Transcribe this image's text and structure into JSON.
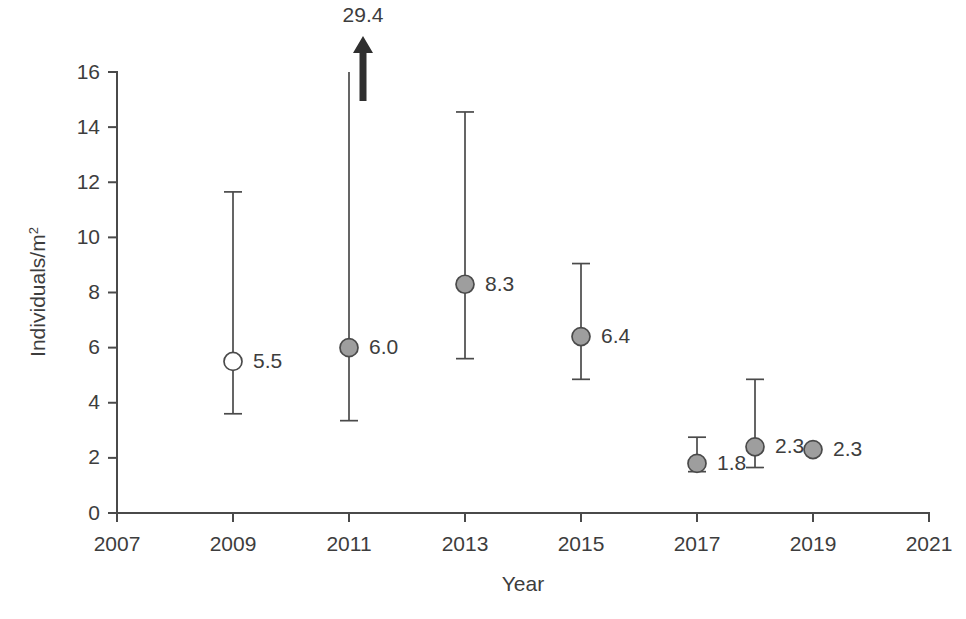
{
  "chart_data": {
    "type": "scatter",
    "title": "",
    "xlabel": "Year",
    "ylabel": "Individuals/m2",
    "ylabel_base": "Individuals/m",
    "ylabel_superscript": "2",
    "xlim": [
      2007,
      2021
    ],
    "ylim": [
      0,
      16
    ],
    "xticks": [
      "2007",
      "2009",
      "2011",
      "2013",
      "2015",
      "2017",
      "2019",
      "2021"
    ],
    "xtick_values": [
      2007,
      2009,
      2011,
      2013,
      2015,
      2017,
      2019,
      2021
    ],
    "yticks": [
      "0",
      "2",
      "4",
      "6",
      "8",
      "10",
      "12",
      "14",
      "16"
    ],
    "ytick_values": [
      0,
      2,
      4,
      6,
      8,
      10,
      12,
      14,
      16
    ],
    "grid": false,
    "legend": "none",
    "series": [
      {
        "name": "Density with 95% CI",
        "points": [
          {
            "x": 2009,
            "y": 5.5,
            "label": "5.5",
            "ci_low": 3.6,
            "ci_high": 11.65,
            "marker": "open-circle",
            "has_error_bar": true,
            "capped_arrow": false
          },
          {
            "x": 2011,
            "y": 6.0,
            "label": "6.0",
            "ci_low": 3.35,
            "ci_high": 29.4,
            "marker": "filled-circle",
            "has_error_bar": true,
            "capped_arrow": true,
            "arrow_label": "29.4"
          },
          {
            "x": 2013,
            "y": 8.3,
            "label": "8.3",
            "ci_low": 5.6,
            "ci_high": 14.55,
            "marker": "filled-circle",
            "has_error_bar": true,
            "capped_arrow": false
          },
          {
            "x": 2015,
            "y": 6.4,
            "label": "6.4",
            "ci_low": 4.85,
            "ci_high": 9.05,
            "marker": "filled-circle",
            "has_error_bar": true,
            "capped_arrow": false
          },
          {
            "x": 2017,
            "y": 1.8,
            "label": "1.8",
            "ci_low": 1.5,
            "ci_high": 2.75,
            "marker": "filled-circle",
            "has_error_bar": true,
            "capped_arrow": false
          },
          {
            "x": 2018,
            "y": 2.4,
            "label": "2.3",
            "ci_low": 1.65,
            "ci_high": 4.85,
            "marker": "filled-circle",
            "has_error_bar": true,
            "capped_arrow": false
          },
          {
            "x": 2019,
            "y": 2.3,
            "label": "2.3",
            "ci_low": null,
            "ci_high": null,
            "marker": "filled-circle",
            "has_error_bar": false,
            "capped_arrow": false
          }
        ]
      }
    ],
    "colors": {
      "marker_fill": "#9e9e9e",
      "marker_open_fill": "#ffffff",
      "line": "#4a4a4a",
      "text": "#3d3d3d",
      "arrow": "#2f2f2f",
      "background": "#ffffff"
    }
  }
}
